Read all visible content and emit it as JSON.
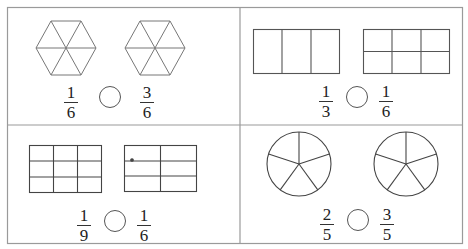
{
  "worksheet": {
    "instruction": "Compare the fractions",
    "panels": [
      {
        "id": "hexagons",
        "shape": "hexagon",
        "parts": 6,
        "left": {
          "num": "1",
          "den": "6"
        },
        "right": {
          "num": "3",
          "den": "6"
        }
      },
      {
        "id": "rectangles",
        "shape": "rectangle",
        "left_parts": 3,
        "right_parts": 6,
        "left": {
          "num": "1",
          "den": "3"
        },
        "right": {
          "num": "1",
          "den": "6"
        }
      },
      {
        "id": "grids",
        "shape": "grid",
        "left_parts": 9,
        "right_parts": 6,
        "left": {
          "num": "1",
          "den": "9"
        },
        "right": {
          "num": "1",
          "den": "6"
        }
      },
      {
        "id": "circles",
        "shape": "circle",
        "parts": 5,
        "left": {
          "num": "2",
          "den": "5"
        },
        "right": {
          "num": "3",
          "den": "5"
        }
      }
    ]
  },
  "colors": {
    "border": "#9a9a9a",
    "line": "#555555",
    "text": "#222222"
  }
}
